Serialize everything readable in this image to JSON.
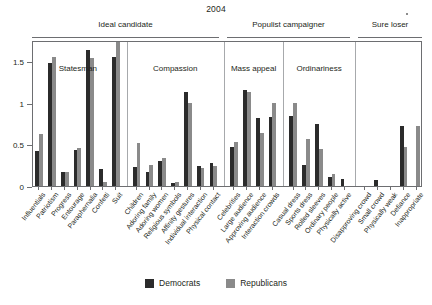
{
  "chart_data": {
    "type": "bar",
    "title": "2004",
    "xlabel": "",
    "ylabel": "",
    "ylim": [
      0,
      1.75
    ],
    "yticks": [
      0,
      0.5,
      1,
      1.5
    ],
    "ytick_labels": [
      "0",
      "0.5",
      "1",
      "1.5"
    ],
    "grid": false,
    "legend_position": "bottom-center",
    "series": [
      {
        "name": "Democrats",
        "color": "#2b2b2b",
        "values": [
          0.42,
          1.47,
          0.17,
          0.43,
          1.63,
          0.2,
          1.55,
          0.23,
          0.17,
          0.3,
          0.04,
          1.13,
          0.24,
          0.28,
          0.47,
          1.15,
          0.82,
          0.83,
          0.84,
          0.25,
          0.74,
          0.11,
          0.08,
          0.0,
          0.07,
          0.0,
          0.72,
          0.0
        ]
      },
      {
        "name": "Republicans",
        "color": "#8a8a8a",
        "values": [
          0.62,
          1.55,
          0.17,
          0.45,
          1.53,
          0.05,
          1.8,
          0.52,
          0.25,
          0.33,
          0.05,
          1.0,
          0.22,
          0.24,
          0.53,
          1.13,
          0.64,
          1.0,
          1.0,
          0.56,
          0.44,
          0.14,
          0.0,
          0.0,
          0.0,
          0.0,
          0.47,
          0.72
        ]
      }
    ],
    "categories": [
      "Influentials",
      "Patriotism",
      "Progress",
      "Entourage",
      "Paraphernalia",
      "Confetti",
      "Suit",
      "Children",
      "Adoring family",
      "Adoring women",
      "Religious symbols",
      "Affinity gestures",
      "Individual interaction",
      "Physical contact",
      "Celebrities",
      "Large audience",
      "Approving audience",
      "Interaction crowds",
      "Casual dress",
      "Sports dress",
      "Rolled sleeves",
      "Ordinary people",
      "Physically active",
      "Disapproving crowd",
      "Small crowd",
      "Physically weak",
      "Defiance",
      "Inappropriate"
    ],
    "supergroups": [
      {
        "label": "Ideal candidate",
        "start_index": 0,
        "end_index": 13
      },
      {
        "label": "Populist campaigner",
        "start_index": 14,
        "end_index": 22
      },
      {
        "label": "Sure loser",
        "start_index": 23,
        "end_index": 27
      }
    ],
    "panels": [
      {
        "label": "Statesman",
        "start_index": 0,
        "end_index": 6
      },
      {
        "label": "Compassion",
        "start_index": 7,
        "end_index": 13
      },
      {
        "label": "Mass appeal",
        "start_index": 14,
        "end_index": 17
      },
      {
        "label": "Ordinariness",
        "start_index": 18,
        "end_index": 22
      },
      {
        "label": "",
        "start_index": 23,
        "end_index": 27
      }
    ]
  },
  "legend": {
    "entries": [
      {
        "label": "Democrats",
        "color": "#2b2b2b"
      },
      {
        "label": "Republicans",
        "color": "#8a8a8a"
      }
    ]
  }
}
